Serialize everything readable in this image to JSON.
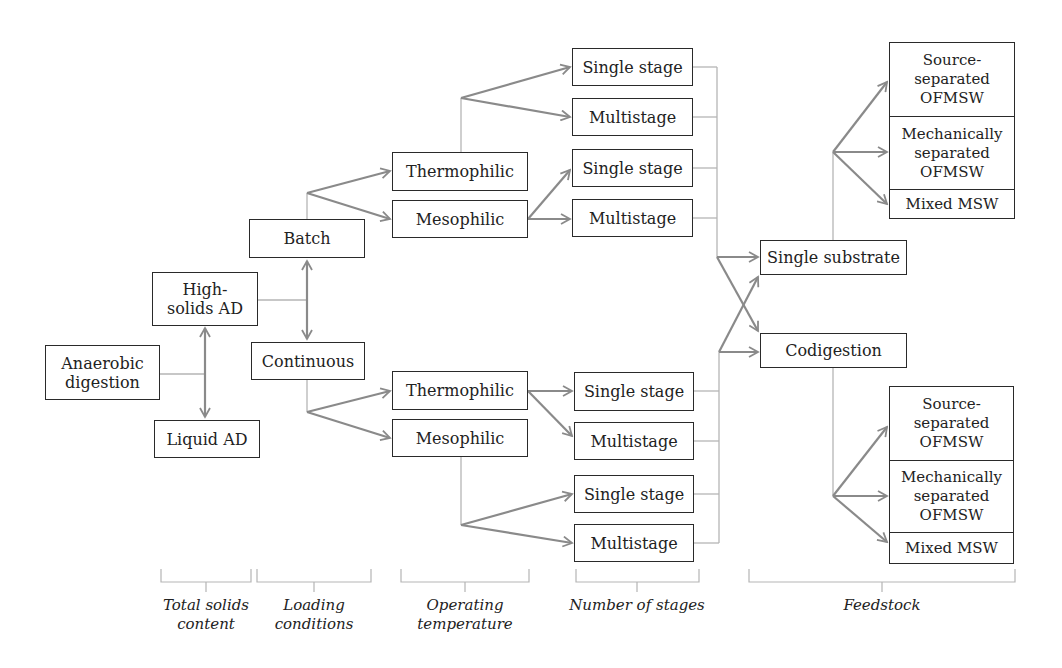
{
  "diagram": {
    "root": "Anaerobic\ndigestion",
    "total_solids": {
      "high": "High-\nsolids AD",
      "liquid": "Liquid AD"
    },
    "loading": {
      "batch": "Batch",
      "continuous": "Continuous"
    },
    "temperature": {
      "batch_thermo": "Thermophilic",
      "batch_meso": "Mesophilic",
      "cont_thermo": "Thermophilic",
      "cont_meso": "Mesophilic"
    },
    "stages": {
      "bt_single": "Single stage",
      "bt_multi": "Multistage",
      "bm_single": "Single stage",
      "bm_multi": "Multistage",
      "ct_single": "Single stage",
      "ct_multi": "Multistage",
      "cm_single": "Single stage",
      "cm_multi": "Multistage"
    },
    "feedstock_type": {
      "single": "Single substrate",
      "co": "Codigestion"
    },
    "feedstock_single": [
      "Source-\nseparated\nOFMSW",
      "Mechanically\nseparated\nOFMSW",
      "Mixed MSW"
    ],
    "feedstock_co": [
      "Source-\nseparated\nOFMSW",
      "Mechanically\nseparated\nOFMSW",
      "Mixed MSW"
    ]
  },
  "categories": [
    "Total solids\ncontent",
    "Loading\nconditions",
    "Operating\ntemperature",
    "Number of stages",
    "Feedstock"
  ],
  "colors": {
    "arrow": "#8a8a8a",
    "thin_line": "#b5b5b5",
    "box_border": "#2a2a2a",
    "text": "#222222"
  }
}
